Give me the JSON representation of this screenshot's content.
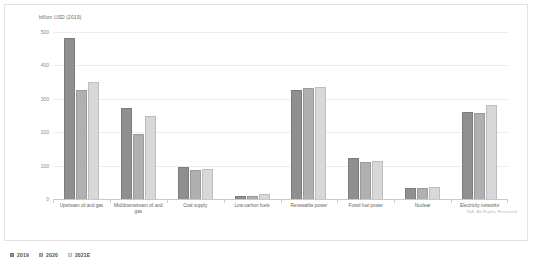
{
  "chart_data": {
    "type": "bar",
    "title": "",
    "subtitle": "",
    "xlabel": "",
    "ylabel": "billion USD (2019)",
    "ylim": [
      0,
      500
    ],
    "yticks": [
      500,
      400,
      300,
      200,
      100,
      0
    ],
    "ytick_labels": [
      "500",
      "400",
      "300",
      "200",
      "100",
      "0"
    ],
    "grid": true,
    "legend_position": "bottom-left",
    "categories": [
      "Upstream oil and gas",
      "Mid/downstream oil and gas",
      "Coal supply",
      "Low-carbon fuels",
      "Renewable power",
      "Fossil fuel power",
      "Nuclear",
      "Electricity networks"
    ],
    "series": [
      {
        "name": "2019",
        "color": "#8f8f8f",
        "values": [
          483,
          272,
          97,
          8,
          325,
          124,
          33,
          262
        ]
      },
      {
        "name": "2020",
        "color": "#b0b0b0",
        "values": [
          325,
          196,
          88,
          10,
          332,
          110,
          34,
          257
        ]
      },
      {
        "name": "2021E",
        "color": "#d8d8d8",
        "values": [
          350,
          250,
          90,
          14,
          336,
          114,
          35,
          281
        ]
      }
    ]
  },
  "footer": {
    "copyright": "IEA. All Rights Reserved"
  }
}
